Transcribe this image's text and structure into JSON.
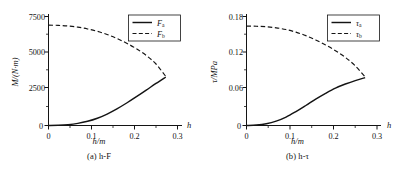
{
  "figure": {
    "background": "#ffffff",
    "line_color": "#141414",
    "panels": [
      {
        "id": "panel-a",
        "caption": "(a) h-F",
        "caption_axis": "h/m",
        "ylabel": "M/(N·m)",
        "xlabel_end": "h",
        "legend": [
          {
            "label": "F",
            "sub": "a",
            "style": "solid"
          },
          {
            "label": "F",
            "sub": "b",
            "style": "dashed"
          }
        ],
        "chart_data": {
          "type": "line",
          "title": "(a) h-F",
          "xlabel": "h/m",
          "ylabel": "M/(N·m)",
          "xlim": [
            0,
            0.33
          ],
          "ylim": [
            0,
            7800
          ],
          "xticks": [
            0,
            0.1,
            0.2,
            0.3
          ],
          "xtick_labels": [
            "0",
            "0.1",
            "0.2",
            "0.3"
          ],
          "yticks": [
            0,
            2500,
            5000,
            7500
          ],
          "ytick_labels": [
            "0",
            "2500",
            "5000",
            "7500"
          ],
          "grid": false,
          "legend_position": "top-right",
          "x": [
            0,
            0.025,
            0.05,
            0.075,
            0.1,
            0.125,
            0.15,
            0.175,
            0.2,
            0.225,
            0.25,
            0.275,
            0.3
          ],
          "series": [
            {
              "name": "F_a",
              "style": "solid",
              "values": [
                0,
                15,
                60,
                150,
                300,
                520,
                820,
                1190,
                1610,
                2060,
                2530,
                3010,
                3470
              ]
            },
            {
              "name": "F_b",
              "style": "dashed",
              "values": [
                7180,
                7165,
                7120,
                7040,
                6910,
                6740,
                6510,
                6230,
                5890,
                5490,
                5010,
                4400,
                3510
              ]
            }
          ]
        }
      },
      {
        "id": "panel-b",
        "caption": "(b) h-τ",
        "caption_axis": "h/m",
        "ylabel": "τ/MPa",
        "xlabel_end": "h",
        "legend": [
          {
            "label": "τ",
            "sub": "a",
            "style": "solid"
          },
          {
            "label": "τ",
            "sub": "b",
            "style": "dashed"
          }
        ],
        "chart_data": {
          "type": "line",
          "title": "(b) h-τ",
          "xlabel": "h/m",
          "ylabel": "τ/MPa",
          "xlim": [
            0,
            0.33
          ],
          "ylim": [
            0,
            0.188
          ],
          "xticks": [
            0,
            0.1,
            0.2,
            0.3
          ],
          "xtick_labels": [
            "0",
            "0.1",
            "0.2",
            "0.3"
          ],
          "yticks": [
            0,
            0.06,
            0.12,
            0.18
          ],
          "ytick_labels": [
            "0",
            "0.06",
            "0.12",
            "0.18"
          ],
          "grid": false,
          "legend_position": "top-right",
          "x": [
            0,
            0.025,
            0.05,
            0.075,
            0.1,
            0.125,
            0.15,
            0.175,
            0.2,
            0.225,
            0.25,
            0.275,
            0.3
          ],
          "series": [
            {
              "name": "τ_a",
              "style": "solid",
              "values": [
                0,
                0.0008,
                0.003,
                0.0075,
                0.0145,
                0.024,
                0.0345,
                0.0455,
                0.0555,
                0.0645,
                0.0715,
                0.0775,
                0.0825
              ]
            },
            {
              "name": "τ_b",
              "style": "dashed",
              "values": [
                0.1715,
                0.1712,
                0.1703,
                0.1685,
                0.1655,
                0.161,
                0.155,
                0.1475,
                0.139,
                0.129,
                0.1175,
                0.103,
                0.0838
              ]
            }
          ]
        }
      }
    ]
  }
}
